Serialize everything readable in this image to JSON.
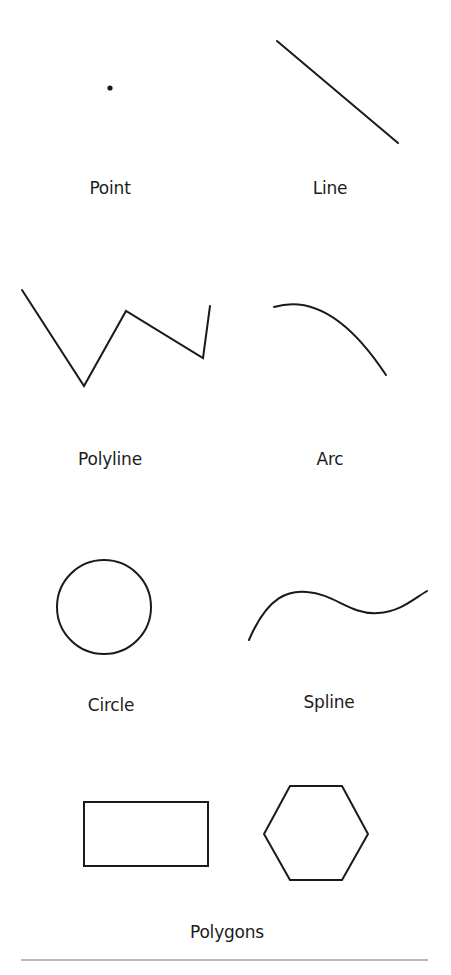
{
  "stroke_color": "#1a1a1a",
  "divider_color": "#b8b8b8",
  "shapes": [
    {
      "id": "point",
      "label": "Point",
      "label_x": 110,
      "label_y": 178,
      "x": 110,
      "y": 88
    },
    {
      "id": "line",
      "label": "Line",
      "label_x": 330,
      "label_y": 178,
      "points": [
        [
          277,
          41
        ],
        [
          398,
          143
        ]
      ]
    },
    {
      "id": "polyline",
      "label": "Polyline",
      "label_x": 110,
      "label_y": 449,
      "points": [
        [
          22,
          290
        ],
        [
          84,
          386
        ],
        [
          126,
          311
        ],
        [
          203,
          358
        ],
        [
          210,
          306
        ]
      ]
    },
    {
      "id": "arc",
      "label": "Arc",
      "label_x": 330,
      "label_y": 449,
      "path": "M274 307 Q330 290 386 375"
    },
    {
      "id": "circle",
      "label": "Circle",
      "label_x": 111,
      "label_y": 695,
      "cx": 104,
      "cy": 607,
      "r": 47
    },
    {
      "id": "spline",
      "label": "Spline",
      "label_x": 329,
      "label_y": 692,
      "path": "M249 640 C268 595 290 590 307 592 C335 594 350 615 378 613 C400 612 415 598 427 591"
    },
    {
      "id": "rectangle",
      "x": 84,
      "y": 802,
      "width": 124,
      "height": 64
    },
    {
      "id": "hexagon",
      "points": [
        [
          290,
          786
        ],
        [
          342,
          786
        ],
        [
          368,
          834
        ],
        [
          342,
          880
        ],
        [
          290,
          880
        ],
        [
          264,
          834
        ]
      ]
    }
  ],
  "group_label": {
    "text": "Polygons",
    "x": 227,
    "y": 922
  }
}
